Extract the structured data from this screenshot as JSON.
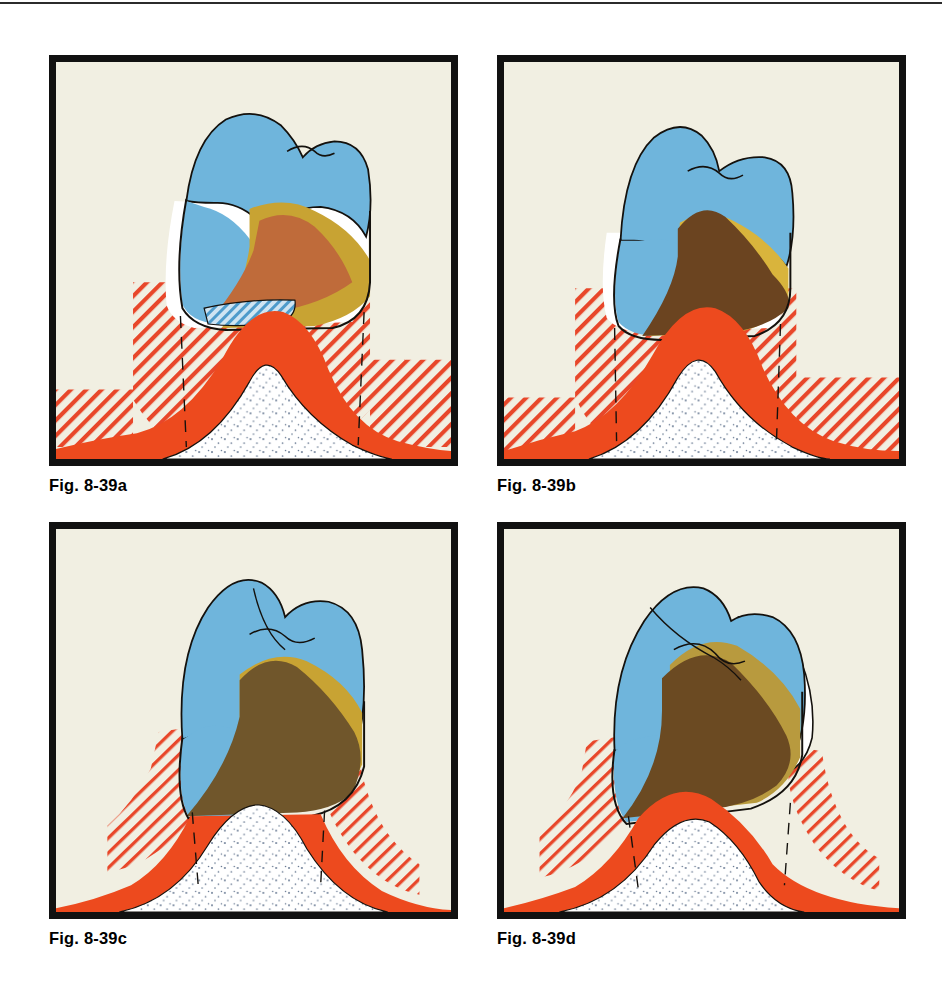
{
  "page": {
    "background": "#ffffff",
    "rule_color": "#2b2b2b",
    "panel_background": "#f1efe2",
    "frame_color": "#111111"
  },
  "palette": {
    "enamel_blue": "#6FB5DC",
    "enamel_blue_dark": "#5AA6D2",
    "dentin_gold": "#C8A333",
    "dentin_gold_light": "#D9B43C",
    "dentin_gold_deep": "#B89A3E",
    "pulp_rust": "#BF6B3A",
    "pulp_brown_dark": "#6B4420",
    "pulp_brown_olive": "#70562B",
    "pulp_brown_d": "#6B4A22",
    "gingiva_red": "#ED4A1E",
    "hatch_red": "#E8472A",
    "bone_white": "#ffffff",
    "bone_stipple": "#5C6F8A",
    "outline_black": "#14110d",
    "cementum_white": "#ffffff"
  },
  "figures": [
    {
      "id": "a",
      "caption": "Fig. 8-39a",
      "panel_name": "figure-panel-a",
      "description": "Molar with rust-colored pulp chamber, wide gold dentin band, blue enamel cap and blue-hatched interproximal contact band at the cervical line; red stippled gingiva over dotted alveolar bone.",
      "layers": [
        "enamel",
        "dentin",
        "pulp",
        "contact-band",
        "gingiva",
        "bone",
        "hatch",
        "dashed-guides"
      ],
      "pulp_color_key": "pulp_rust",
      "has_contact_band": true,
      "has_cementum_gap": true
    },
    {
      "id": "b",
      "caption": "Fig. 8-39b",
      "panel_name": "figure-panel-b",
      "description": "Molar with dark brown pulp mass rising into a narrow gold dentin collar; crown seated lower on the red gingival crest with tall stippled bone peak.",
      "layers": [
        "enamel",
        "dentin",
        "pulp",
        "gingiva",
        "bone",
        "hatch",
        "dashed-guides"
      ],
      "pulp_color_key": "pulp_brown_dark",
      "has_contact_band": true,
      "has_cementum_gap": true
    },
    {
      "id": "c",
      "caption": "Fig. 8-39c",
      "panel_name": "figure-panel-c",
      "description": "Molar seated deepest, olive-brown pulp band below gold dentin, blue enamel crown; broad flat red gingiva and wide dotted bone mound, minimal hatching.",
      "layers": [
        "enamel",
        "dentin",
        "pulp",
        "gingiva",
        "bone",
        "hatch",
        "dashed-guides"
      ],
      "pulp_color_key": "pulp_brown_olive",
      "has_contact_band": false,
      "has_cementum_gap": false
    },
    {
      "id": "d",
      "caption": "Fig. 8-39d",
      "panel_name": "figure-panel-d",
      "description": "Tilted molar, dark brown pulp sweeping diagonally beneath gold dentin and blue enamel, exposed white cementum on the distal surface; red gingiva over dotted bone.",
      "layers": [
        "enamel",
        "dentin",
        "pulp",
        "cementum",
        "gingiva",
        "bone",
        "hatch",
        "dashed-guides"
      ],
      "pulp_color_key": "pulp_brown_d",
      "has_contact_band": false,
      "has_cementum_gap": true
    }
  ]
}
